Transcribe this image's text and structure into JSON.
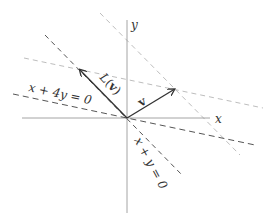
{
  "diagram": {
    "axes": {
      "x_label": "x",
      "y_label": "y",
      "origin": [
        127,
        118
      ],
      "x_axis": {
        "from": [
          22,
          118
        ],
        "to": [
          210,
          118
        ]
      },
      "y_axis": {
        "from": [
          127,
          20
        ],
        "to": [
          127,
          213
        ]
      },
      "color": "#9a9a9a"
    },
    "vectors": [
      {
        "id": "v",
        "label": "v",
        "tip": [
          175,
          89
        ],
        "color": "#333333"
      },
      {
        "id": "Lv",
        "label": "L(v)",
        "tip": [
          79,
          69
        ],
        "color": "#333333"
      }
    ],
    "lines": [
      {
        "id": "x-plus-4y",
        "label": "x + 4y = 0",
        "from": [
          13,
          94
        ],
        "to": [
          255,
          145
        ],
        "color": "#555555",
        "style": "dashed"
      },
      {
        "id": "x-plus-y",
        "label": "x + y = 0",
        "from": [
          45,
          35
        ],
        "to": [
          183,
          176
        ],
        "color": "#555555",
        "style": "dashed"
      },
      {
        "id": "parallel-through-Lv",
        "from": [
          24,
          58
        ],
        "to": [
          263,
          108
        ],
        "color": "#b5b5b5",
        "style": "dashed"
      },
      {
        "id": "parallel-through-v",
        "from": [
          100,
          13
        ],
        "to": [
          240,
          155
        ],
        "color": "#b5b5b5",
        "style": "dashed"
      }
    ],
    "labels": {
      "x_axis": "x",
      "y_axis": "y",
      "v": "v",
      "Lv_L": "L",
      "Lv_open": "(",
      "Lv_v": "v",
      "Lv_close": ")",
      "line1": "x + 4y = 0",
      "line2": "x + y = 0"
    }
  }
}
